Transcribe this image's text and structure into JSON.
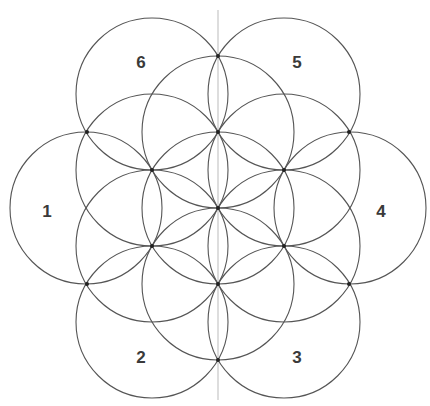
{
  "diagram": {
    "type": "flower-of-life-construction",
    "center": [
      218,
      208
    ],
    "radius": 76,
    "stroke_color": "#555555",
    "axis_color": "#bbbbbb",
    "dot_color": "#222222",
    "axis_line": {
      "x": 218,
      "y1": 10,
      "y2": 400
    },
    "inner_circles": [
      {
        "cx": 218,
        "cy": 208
      },
      {
        "cx": 218,
        "cy": 132
      },
      {
        "cx": 284,
        "cy": 170
      },
      {
        "cx": 284,
        "cy": 246
      },
      {
        "cx": 218,
        "cy": 284
      },
      {
        "cx": 152,
        "cy": 246
      },
      {
        "cx": 152,
        "cy": 170
      }
    ],
    "outer_circles": [
      {
        "id": "1",
        "cx": 86,
        "cy": 208
      },
      {
        "id": "2",
        "cx": 152,
        "cy": 322
      },
      {
        "id": "3",
        "cx": 284,
        "cy": 322
      },
      {
        "id": "4",
        "cx": 350,
        "cy": 208
      },
      {
        "id": "5",
        "cx": 284,
        "cy": 94
      },
      {
        "id": "6",
        "cx": 152,
        "cy": 94
      }
    ],
    "dots": [
      [
        218,
        56
      ],
      [
        218,
        132
      ],
      [
        218,
        208
      ],
      [
        218,
        284
      ],
      [
        218,
        360
      ],
      [
        87,
        132
      ],
      [
        87,
        284
      ],
      [
        349,
        132
      ],
      [
        349,
        284
      ],
      [
        152,
        170
      ],
      [
        152,
        246
      ],
      [
        284,
        170
      ],
      [
        284,
        246
      ]
    ],
    "labels": [
      {
        "text": "1",
        "x": 47,
        "y": 211
      },
      {
        "text": "2",
        "x": 141,
        "y": 357
      },
      {
        "text": "3",
        "x": 297,
        "y": 357
      },
      {
        "text": "4",
        "x": 381,
        "y": 211
      },
      {
        "text": "5",
        "x": 297,
        "y": 62
      },
      {
        "text": "6",
        "x": 141,
        "y": 62
      }
    ]
  }
}
